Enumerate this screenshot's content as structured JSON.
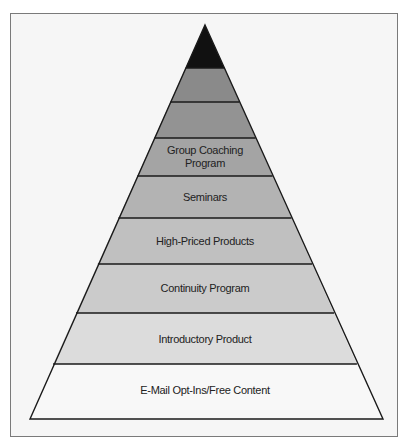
{
  "diagram": {
    "type": "pyramid",
    "title": "",
    "layers_top_to_bottom": [
      {
        "label": "",
        "fill": "#111111"
      },
      {
        "label": "",
        "fill": "#8a8a8a"
      },
      {
        "label": "",
        "fill": "#939393"
      },
      {
        "label": "Group Coaching Program",
        "line1": "Group Coaching",
        "line2": "Program",
        "fill": "#a4a4a4"
      },
      {
        "label": "Seminars",
        "fill": "#b3b3b3"
      },
      {
        "label": "High-Priced Products",
        "fill": "#c0c0c0"
      },
      {
        "label": "Continuity Program",
        "fill": "#cbcbcb"
      },
      {
        "label": "Introductory Product",
        "fill": "#dcdcdc"
      },
      {
        "label": "E-Mail Opt-Ins/Free Content",
        "fill": "#f8f8f8"
      }
    ]
  }
}
